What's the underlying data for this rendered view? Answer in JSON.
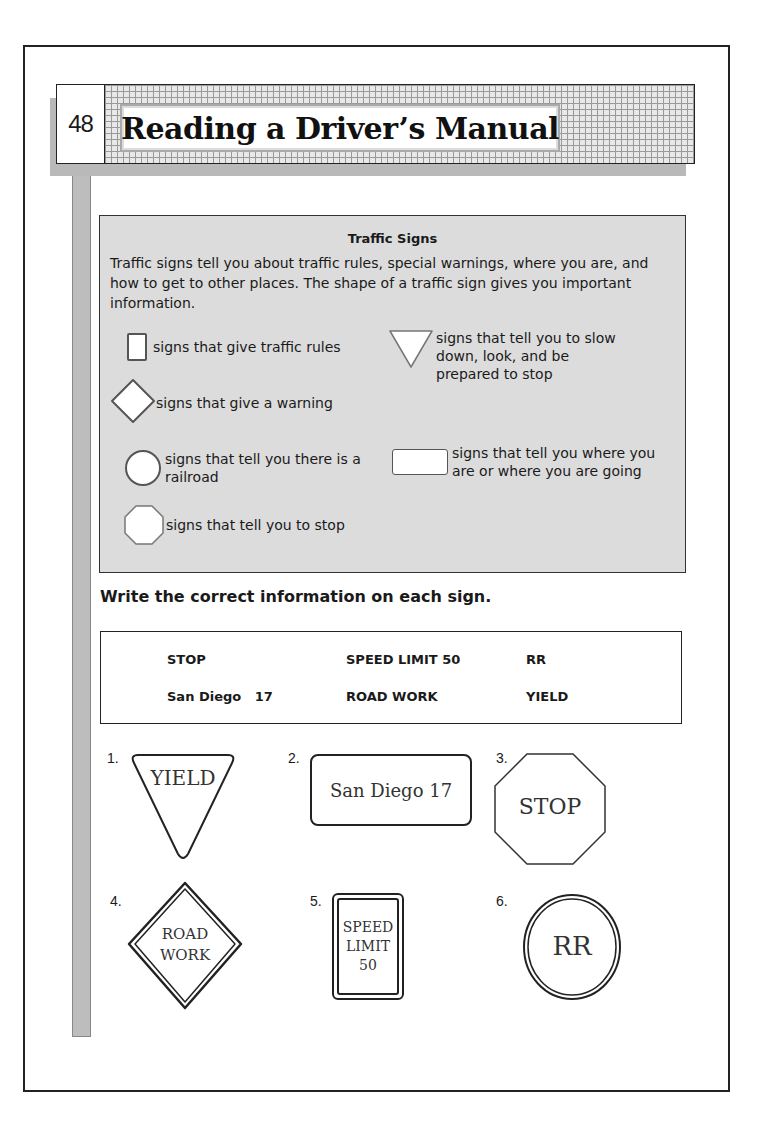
{
  "header": {
    "page_number": "48",
    "title": "Reading a Driver’s Manual"
  },
  "info_box": {
    "title": "Traffic Signs",
    "paragraph": "Traffic signs tell you about traffic rules, special warnings, where you are, and how to get to other places. The shape of a traffic sign gives you important information.",
    "legend": [
      {
        "shape": "vertical-rectangle",
        "label": "signs that give traffic rules"
      },
      {
        "shape": "diamond",
        "label": "signs that give a warning"
      },
      {
        "shape": "circle",
        "label": "signs that tell you there is a railroad"
      },
      {
        "shape": "octagon",
        "label": "signs that tell you to stop"
      },
      {
        "shape": "inverted-triangle",
        "label": "signs that tell you to slow down, look, and be prepared to stop"
      },
      {
        "shape": "horizontal-rectangle",
        "label": "signs that tell you where you are or where you are going"
      }
    ]
  },
  "exercise": {
    "instruction": "Write the correct information on each sign.",
    "word_bank": [
      [
        "STOP",
        "SPEED LIMIT 50",
        "RR"
      ],
      [
        "San Diego   17",
        "ROAD WORK",
        "YIELD"
      ]
    ],
    "signs": [
      {
        "number": "1.",
        "shape": "inverted-triangle",
        "lines": [
          "YIELD"
        ]
      },
      {
        "number": "2.",
        "shape": "horizontal-rectangle",
        "lines": [
          "San Diego 17"
        ]
      },
      {
        "number": "3.",
        "shape": "octagon",
        "lines": [
          "STOP"
        ]
      },
      {
        "number": "4.",
        "shape": "diamond",
        "lines": [
          "ROAD",
          "WORK"
        ]
      },
      {
        "number": "5.",
        "shape": "vertical-rectangle",
        "lines": [
          "SPEED",
          "LIMIT",
          "50"
        ]
      },
      {
        "number": "6.",
        "shape": "circle",
        "lines": [
          "RR"
        ]
      }
    ]
  }
}
